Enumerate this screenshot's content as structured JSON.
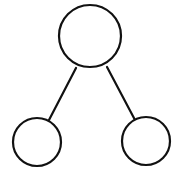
{
  "diagram": {
    "type": "tree",
    "stroke_color": "#111111",
    "fill_color": "#ffffff",
    "stroke_width": 2.2,
    "nodes": [
      {
        "id": "root",
        "cx": 90,
        "cy": 36,
        "r": 31,
        "label": ""
      },
      {
        "id": "left-child",
        "cx": 37,
        "cy": 142,
        "r": 24,
        "label": ""
      },
      {
        "id": "right-child",
        "cx": 146,
        "cy": 141,
        "r": 24,
        "label": ""
      }
    ],
    "edges": [
      {
        "from": "root",
        "to": "left-child",
        "x1": 76,
        "y1": 68,
        "x2": 49,
        "y2": 120
      },
      {
        "from": "root",
        "to": "right-child",
        "x1": 107,
        "y1": 67,
        "x2": 135,
        "y2": 120
      }
    ]
  }
}
